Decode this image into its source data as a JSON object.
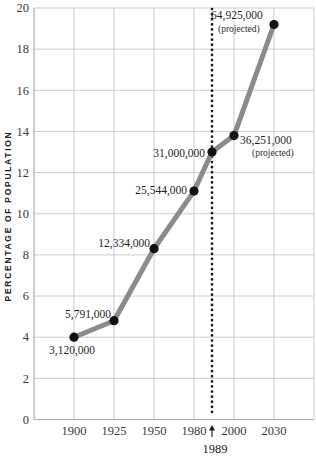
{
  "chart_data": {
    "type": "line",
    "title": "",
    "xlabel": "",
    "ylabel": "PERCENTAGE OF POPULATION",
    "ylim": [
      0,
      20
    ],
    "grid": true,
    "yticks": [
      "0",
      "2",
      "4",
      "6",
      "8",
      "10",
      "12",
      "14",
      "16",
      "18",
      "20"
    ],
    "xticks": [
      "1900",
      "1925",
      "1950",
      "1980",
      "2000",
      "2030"
    ],
    "xtick_years": [
      1900,
      1925,
      1950,
      1980,
      2000,
      2030
    ],
    "projected_label": "(projected)",
    "reference_line": {
      "year": 1989,
      "label": "1989"
    },
    "points": [
      {
        "year": 1900,
        "pct": 4.0,
        "value_label": "3,120,000",
        "projected": false,
        "anchor": "middle",
        "dx": -2,
        "dy": 17
      },
      {
        "year": 1925,
        "pct": 4.8,
        "value_label": "5,791,000",
        "projected": false,
        "anchor": "end",
        "dx": -3,
        "dy": -3
      },
      {
        "year": 1950,
        "pct": 8.3,
        "value_label": "12,334,000",
        "projected": false,
        "anchor": "end",
        "dx": -4,
        "dy": -2
      },
      {
        "year": 1980,
        "pct": 11.1,
        "value_label": "25,544,000",
        "projected": false,
        "anchor": "end",
        "dx": -7,
        "dy": 3
      },
      {
        "year": 1989,
        "pct": 13.0,
        "value_label": "31,000,000",
        "projected": false,
        "anchor": "end",
        "dx": -7,
        "dy": 5
      },
      {
        "year": 2000,
        "pct": 13.8,
        "value_label": "36,251,000",
        "projected": true,
        "anchor": "start",
        "dx": 6,
        "dy": 8,
        "pdx": 18,
        "pdy": 20
      },
      {
        "year": 2030,
        "pct": 19.2,
        "value_label": "64,925,000",
        "projected": true,
        "anchor": "start",
        "dx": -63,
        "dy": -6,
        "pdx": -56,
        "pdy": 7
      }
    ],
    "colors": {
      "line": "#8b8b8b",
      "point": "#111111",
      "grid": "#cccccc",
      "axis": "#aaaaaa",
      "reference": "#1a1a1a",
      "text": "#1f1f1f"
    }
  }
}
